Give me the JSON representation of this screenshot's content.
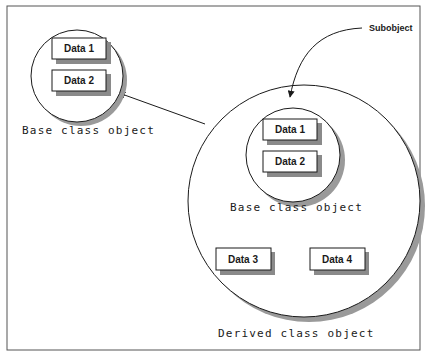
{
  "diagram": {
    "base_object": {
      "label": "Base class object",
      "fields": [
        "Data 1",
        "Data 2"
      ]
    },
    "derived_object": {
      "label": "Derived class object",
      "subobject": {
        "label": "Base class object",
        "fields": [
          "Data 1",
          "Data 2"
        ]
      },
      "fields": [
        "Data 3",
        "Data 4"
      ]
    },
    "callout": "Subobject",
    "edges": [
      {
        "from": "derived_object",
        "to": "base_object",
        "style": "arrow"
      },
      {
        "from": "callout",
        "to": "derived_object.subobject",
        "style": "curved-arrow"
      }
    ]
  }
}
